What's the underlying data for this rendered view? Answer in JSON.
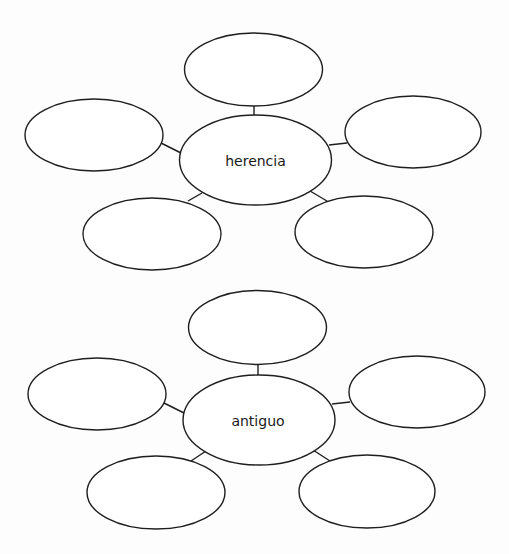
{
  "page": {
    "background": "#fdfdfd",
    "stroke_color": "#1e1e1e"
  },
  "web_diagrams": [
    {
      "center_label": "herencia",
      "center": {
        "cx": 255.5,
        "cy": 160,
        "rx": 76,
        "ry": 45
      },
      "outer_nodes": [
        {
          "position": "top",
          "label": "",
          "cx": 253.5,
          "cy": 69.5,
          "rx": 69,
          "ry": 36.5
        },
        {
          "position": "left",
          "label": "",
          "cx": 94,
          "cy": 135,
          "rx": 69,
          "ry": 36
        },
        {
          "position": "right",
          "label": "",
          "cx": 413,
          "cy": 132,
          "rx": 68,
          "ry": 36
        },
        {
          "position": "bottom-left",
          "label": "",
          "cx": 152,
          "cy": 234,
          "rx": 69,
          "ry": 36
        },
        {
          "position": "bottom-right",
          "label": "",
          "cx": 364,
          "cy": 232,
          "rx": 69,
          "ry": 36
        }
      ],
      "connectors": [
        {
          "to": "top",
          "x1": 254,
          "y1": 106,
          "x2": 254,
          "y2": 115
        },
        {
          "to": "left",
          "x1": 161,
          "y1": 143,
          "x2": 181,
          "y2": 153
        },
        {
          "to": "right",
          "x1": 329,
          "y1": 145,
          "x2": 347,
          "y2": 143
        },
        {
          "to": "bottom-left",
          "x1": 188,
          "y1": 201,
          "x2": 202,
          "y2": 193
        },
        {
          "to": "bottom-right",
          "x1": 310,
          "y1": 191,
          "x2": 327,
          "y2": 201
        }
      ]
    },
    {
      "center_label": "antiguo",
      "center": {
        "cx": 259,
        "cy": 420,
        "rx": 76,
        "ry": 45
      },
      "outer_nodes": [
        {
          "position": "top",
          "label": "",
          "cx": 257.5,
          "cy": 327.5,
          "rx": 69,
          "ry": 37
        },
        {
          "position": "left",
          "label": "",
          "cx": 97,
          "cy": 394,
          "rx": 69,
          "ry": 36
        },
        {
          "position": "right",
          "label": "",
          "cx": 417,
          "cy": 392,
          "rx": 68,
          "ry": 36
        },
        {
          "position": "bottom-left",
          "label": "",
          "cx": 156,
          "cy": 492.5,
          "rx": 69,
          "ry": 36.5
        },
        {
          "position": "bottom-right",
          "label": "",
          "cx": 367,
          "cy": 491.5,
          "rx": 68,
          "ry": 36.5
        }
      ],
      "connectors": [
        {
          "to": "top",
          "x1": 258,
          "y1": 364,
          "x2": 258,
          "y2": 375
        },
        {
          "to": "left",
          "x1": 164,
          "y1": 403,
          "x2": 184,
          "y2": 413
        },
        {
          "to": "right",
          "x1": 332,
          "y1": 404,
          "x2": 350,
          "y2": 402
        },
        {
          "to": "bottom-left",
          "x1": 191,
          "y1": 461,
          "x2": 206,
          "y2": 451
        },
        {
          "to": "bottom-right",
          "x1": 313,
          "y1": 450,
          "x2": 330,
          "y2": 461
        }
      ]
    }
  ]
}
